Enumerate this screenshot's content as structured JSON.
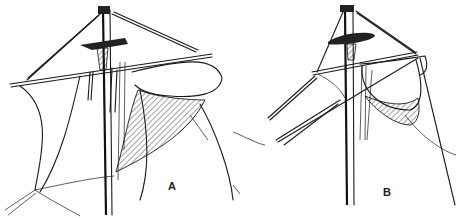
{
  "figure": {
    "panels": [
      {
        "id": "A",
        "label": "A",
        "label_pos": [
          168,
          180
        ]
      },
      {
        "id": "B",
        "label": "B",
        "label_pos": [
          383,
          186
        ]
      }
    ],
    "colors": {
      "ink": "#1a1a1a",
      "background": "#ffffff"
    }
  }
}
